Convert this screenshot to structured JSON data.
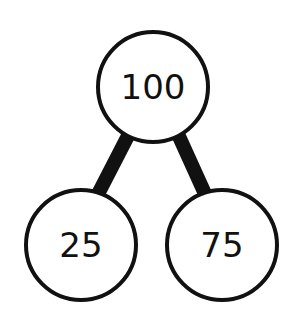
{
  "diagram": {
    "type": "number-bond",
    "whole": "100",
    "parts": [
      "25",
      "75"
    ],
    "colors": {
      "stroke": "#111111",
      "fill": "#ffffff",
      "text": "#111111"
    }
  }
}
